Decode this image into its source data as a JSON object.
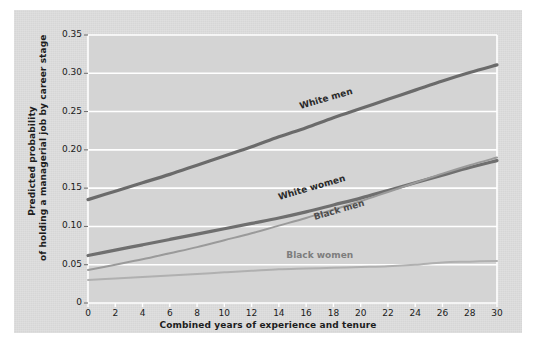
{
  "chart_data": {
    "type": "line",
    "title": "",
    "subtitle": "",
    "xlabel": "Combined years of experience and tenure",
    "ylabel": "Predicted probability of holding a managerial job by career stage",
    "ylabel_line1": "Predicted probability",
    "ylabel_line2": "of holding a managerial job by career stage",
    "xlim": [
      0,
      30
    ],
    "ylim": [
      0,
      0.35
    ],
    "grid": "horizontal",
    "legend": "inline-curve-labels",
    "xticks": [
      0,
      2,
      4,
      6,
      8,
      10,
      12,
      14,
      16,
      18,
      20,
      22,
      24,
      26,
      28,
      30
    ],
    "xtick_labels": [
      "0",
      "2",
      "4",
      "6",
      "8",
      "10",
      "12",
      "14",
      "16",
      "18",
      "20",
      "22",
      "24",
      "26",
      "28",
      "30"
    ],
    "yticks": [
      0,
      0.05,
      0.1,
      0.15,
      0.2,
      0.25,
      0.3,
      0.35
    ],
    "ytick_labels": [
      "0",
      "0.05",
      "0.10",
      "0.15",
      "0.20",
      "0.25",
      "0.30",
      "0.35"
    ],
    "x": [
      0,
      2,
      4,
      6,
      8,
      10,
      12,
      14,
      16,
      18,
      20,
      22,
      24,
      26,
      28,
      30
    ],
    "series": [
      {
        "name": "White men",
        "color": "#6b6b6b",
        "width": 3.2,
        "label_color": "#2a2a2a",
        "label_rotation": -16,
        "values": [
          0.135,
          0.146,
          0.157,
          0.168,
          0.18,
          0.192,
          0.204,
          0.217,
          0.229,
          0.242,
          0.254,
          0.266,
          0.278,
          0.29,
          0.301,
          0.311
        ]
      },
      {
        "name": "White women",
        "color": "#6f6f6f",
        "width": 3.2,
        "label_color": "#2a2a2a",
        "label_rotation": -16,
        "values": [
          0.062,
          0.069,
          0.076,
          0.083,
          0.09,
          0.097,
          0.104,
          0.111,
          0.119,
          0.128,
          0.137,
          0.147,
          0.157,
          0.167,
          0.177,
          0.186
        ]
      },
      {
        "name": "Black men",
        "color": "#9a9a9a",
        "width": 2.0,
        "label_color": "#4d4d4d",
        "label_rotation": -16,
        "values": [
          0.043,
          0.05,
          0.057,
          0.065,
          0.073,
          0.082,
          0.091,
          0.101,
          0.111,
          0.122,
          0.133,
          0.145,
          0.157,
          0.169,
          0.18,
          0.19
        ]
      },
      {
        "name": "Black women",
        "color": "#b0b0b0",
        "width": 2.0,
        "label_color": "#7d7d7d",
        "label_rotation": 0,
        "values": [
          0.03,
          0.032,
          0.034,
          0.036,
          0.038,
          0.04,
          0.042,
          0.044,
          0.045,
          0.046,
          0.047,
          0.048,
          0.05,
          0.053,
          0.054,
          0.055
        ]
      }
    ],
    "plot_background": "#d4d4d4",
    "gridline_color": "#ffffff",
    "page_background": "#ffffff"
  },
  "curve_labels": [
    {
      "text": "White men"
    },
    {
      "text": "White women"
    },
    {
      "text": "Black men"
    },
    {
      "text": "Black women"
    }
  ]
}
